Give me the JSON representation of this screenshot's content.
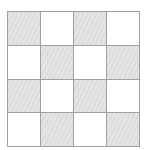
{
  "grid": {
    "rows": 4,
    "cols": 4,
    "colors": {
      "shaded": "#e0e0e0",
      "white": "#ffffff",
      "border": "#a0a0a0"
    },
    "cells": [
      [
        "shaded",
        "white",
        "shaded",
        "white"
      ],
      [
        "white",
        "shaded",
        "white",
        "shaded"
      ],
      [
        "shaded",
        "white",
        "shaded",
        "white"
      ],
      [
        "white",
        "shaded",
        "white",
        "shaded"
      ]
    ]
  }
}
